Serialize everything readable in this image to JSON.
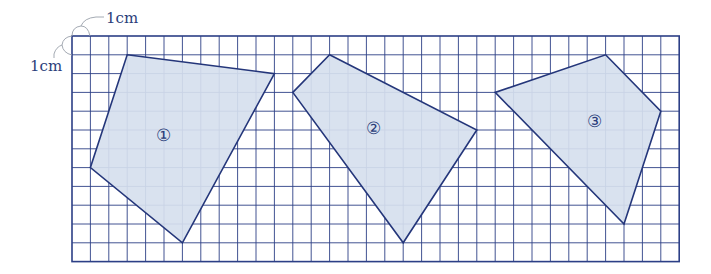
{
  "diagram": {
    "grid": {
      "left": 72,
      "top": 36,
      "cols": 33,
      "rows": 12,
      "cell_w": 18.4,
      "cell_h": 18.8,
      "line_color": "#2c3f86",
      "border_color": "#2c3f86"
    },
    "scale_labels": {
      "horizontal": "1cm",
      "vertical": "1cm"
    },
    "shape_fill": "#d6e0ee",
    "shape_stroke": "#24367a",
    "shapes": [
      {
        "label": "①",
        "vertices": [
          [
            3,
            1
          ],
          [
            11,
            2
          ],
          [
            6,
            11
          ],
          [
            1,
            7
          ]
        ],
        "label_pos": [
          163,
          135
        ]
      },
      {
        "label": "②",
        "vertices": [
          [
            14,
            1
          ],
          [
            22,
            5
          ],
          [
            18,
            11
          ],
          [
            12,
            3
          ]
        ],
        "label_pos": [
          373,
          128
        ]
      },
      {
        "label": "③",
        "vertices": [
          [
            29,
            1
          ],
          [
            32,
            4
          ],
          [
            30,
            10
          ],
          [
            23,
            3
          ]
        ],
        "label_pos": [
          594,
          121
        ]
      }
    ]
  }
}
